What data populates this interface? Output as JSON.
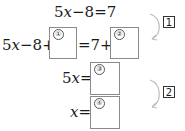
{
  "equations": {
    "line1": {
      "lhs_coef": "5",
      "var": "x",
      "rest": "−8=7"
    },
    "line2": {
      "prefix_coef": "5",
      "var": "x",
      "prefix_rest": "−8+",
      "middle": "=7+"
    },
    "line3": {
      "coef": "5",
      "var": "x",
      "eq": "="
    },
    "line4": {
      "var": "x",
      "eq": "="
    }
  },
  "blanks": [
    {
      "id": "blank-1",
      "label": "①",
      "value": ""
    },
    {
      "id": "blank-2",
      "label": "②",
      "value": ""
    },
    {
      "id": "blank-3",
      "label": "③",
      "value": ""
    },
    {
      "id": "blank-4",
      "label": "④",
      "value": ""
    }
  ],
  "steps": [
    {
      "label": "1"
    },
    {
      "label": "2"
    }
  ],
  "colors": {
    "box_border": "#8a8a8a",
    "arrow": "#bbbbbb",
    "text": "#1a1a1a"
  }
}
